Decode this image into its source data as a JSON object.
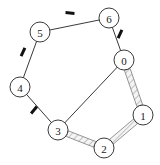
{
  "figure": {
    "kind": "undirected-graph-cycle-diagram",
    "background_color": "#ffffff",
    "width": 160,
    "height": 165
  },
  "style": {
    "node_stroke_color": "#3a3a3a",
    "node_fill_color": "#ffffff",
    "node_radius": 10,
    "node_stroke_width": 1,
    "plain_edge_color": "#3a3a3a",
    "plain_edge_width": 1,
    "tick_color": "#111111",
    "tick_length": 9,
    "tick_width": 3,
    "band_edge_outline_color": "#8a8a8a",
    "band_edge_fill_color": "#f2f2f2",
    "band_edge_hatch_color": "#9a9a9a",
    "band_edge_width": 6
  },
  "nodes": [
    {
      "id": "n0",
      "label": "0",
      "x": 124,
      "y": 60
    },
    {
      "id": "n1",
      "label": "1",
      "x": 143,
      "y": 115
    },
    {
      "id": "n2",
      "label": "2",
      "x": 104,
      "y": 148
    },
    {
      "id": "n3",
      "label": "3",
      "x": 58,
      "y": 130
    },
    {
      "id": "n4",
      "label": "4",
      "x": 20,
      "y": 87
    },
    {
      "id": "n5",
      "label": "5",
      "x": 40,
      "y": 32
    },
    {
      "id": "n6",
      "label": "6",
      "x": 109,
      "y": 18
    }
  ],
  "edges": [
    {
      "id": "e-5-6",
      "from": "n5",
      "to": "n6",
      "style": "plain-ticked",
      "tick": {
        "x": 70,
        "y": 13,
        "angle": 5
      }
    },
    {
      "id": "e-6-0",
      "from": "n6",
      "to": "n0",
      "style": "plain-ticked",
      "tick": {
        "x": 120,
        "y": 34,
        "angle": 115
      }
    },
    {
      "id": "e-0-1",
      "from": "n0",
      "to": "n1",
      "style": "hatched-band"
    },
    {
      "id": "e-1-2",
      "from": "n1",
      "to": "n2",
      "style": "hatched-band"
    },
    {
      "id": "e-2-3",
      "from": "n2",
      "to": "n3",
      "style": "hatched-band"
    },
    {
      "id": "e-3-4",
      "from": "n3",
      "to": "n4",
      "style": "plain-ticked",
      "tick": {
        "x": 34,
        "y": 110,
        "angle": 130
      }
    },
    {
      "id": "e-4-5",
      "from": "n4",
      "to": "n5",
      "style": "plain-ticked",
      "tick": {
        "x": 23,
        "y": 52,
        "angle": 115
      }
    },
    {
      "id": "e-0-3",
      "from": "n0",
      "to": "n3",
      "style": "plain"
    }
  ],
  "chart_data": {
    "type": "graph",
    "title": "",
    "node_count": 7,
    "edge_count": 8,
    "node_labels": [
      "0",
      "1",
      "2",
      "3",
      "4",
      "5",
      "6"
    ],
    "edge_list": [
      [
        "5",
        "6"
      ],
      [
        "6",
        "0"
      ],
      [
        "0",
        "1"
      ],
      [
        "1",
        "2"
      ],
      [
        "2",
        "3"
      ],
      [
        "3",
        "4"
      ],
      [
        "4",
        "5"
      ],
      [
        "0",
        "3"
      ]
    ],
    "edge_annotations": [
      {
        "edge": [
          "5",
          "6"
        ],
        "marking": "tick"
      },
      {
        "edge": [
          "6",
          "0"
        ],
        "marking": "tick"
      },
      {
        "edge": [
          "0",
          "1"
        ],
        "marking": "hatched-band"
      },
      {
        "edge": [
          "1",
          "2"
        ],
        "marking": "hatched-band"
      },
      {
        "edge": [
          "2",
          "3"
        ],
        "marking": "hatched-band"
      },
      {
        "edge": [
          "3",
          "4"
        ],
        "marking": "tick"
      },
      {
        "edge": [
          "4",
          "5"
        ],
        "marking": "tick"
      },
      {
        "edge": [
          "0",
          "3"
        ],
        "marking": "none"
      }
    ]
  }
}
